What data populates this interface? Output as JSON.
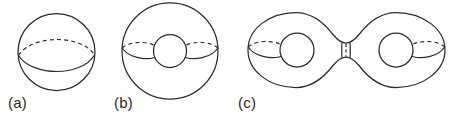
{
  "figure": {
    "caption_labels": {
      "a": "(a)",
      "b": "(b)",
      "c": "(c)"
    },
    "colors": {
      "background": "#ffffff",
      "ink": "#2b2b2b"
    },
    "panels": [
      {
        "id": "a",
        "label": "(a)",
        "name": "sphere",
        "genus": 0,
        "holes": 0,
        "outline": {
          "type": "circle",
          "cx": 56.5,
          "cy": 52,
          "r": 38.5
        },
        "curves": [
          {
            "name": "equator-back-arc",
            "style": "dashed",
            "path": "M 18.5 55.5 C 26 43.5, 44 39.5, 57 39.5 C 71 39.5, 88 44, 94.5 55"
          },
          {
            "name": "equator-front-arc",
            "style": "solid",
            "path": "M 18.5 55.5 C 25 66.5, 43 71.5, 57 71.5 C 71 71.5, 88 66.5, 94.5 55"
          }
        ]
      },
      {
        "id": "b",
        "label": "(b)",
        "name": "torus",
        "genus": 1,
        "holes": 1,
        "outline": {
          "type": "circle",
          "cx": 170,
          "cy": 51,
          "r": 48
        },
        "hole": {
          "type": "circle",
          "cx": 170,
          "cy": 51,
          "r": 16.5
        },
        "curves": [
          {
            "name": "left-handle-back-arc",
            "style": "dashed",
            "path": "M 122.2 48 C 129 41.5, 145 41, 153.6 45"
          },
          {
            "name": "left-handle-front-arc",
            "style": "solid",
            "path": "M 122.2 48 C 128 57.5, 145 60.5, 154.5 57.5"
          },
          {
            "name": "right-handle-back-arc",
            "style": "dashed",
            "path": "M 217.8 48 C 211 41.5, 195 41, 186.4 45"
          },
          {
            "name": "right-handle-front-arc",
            "style": "solid",
            "path": "M 217.8 48 C 212 57.5, 195 60.5, 185.5 57.5"
          }
        ]
      },
      {
        "id": "c",
        "label": "(c)",
        "name": "double-torus",
        "genus": 2,
        "holes": 2,
        "outline": {
          "type": "two-lobes-with-neck",
          "left_lobe": {
            "cx": 297,
            "cy": 50,
            "r": 49
          },
          "right_lobe": {
            "cx": 396,
            "cy": 50,
            "r": 49
          },
          "neck": {
            "cx": 346,
            "cy": 50,
            "half_width": 4.5,
            "half_height": 7
          }
        },
        "holes_geometry": [
          {
            "cx": 297,
            "cy": 50,
            "r": 17
          },
          {
            "cx": 396,
            "cy": 50,
            "r": 17
          }
        ],
        "curves": [
          {
            "name": "left-handle-back-arc",
            "style": "dashed",
            "path": "M 248.3 47 C 255 40.5, 271 40, 279.8 44"
          },
          {
            "name": "left-handle-front-arc",
            "style": "solid",
            "path": "M 248.3 47 C 254 56.5, 271 59.5, 280.6 56.5"
          },
          {
            "name": "right-handle-back-arc",
            "style": "dashed",
            "path": "M 444.7 47 C 438 40.5, 422 40, 413.2 44"
          },
          {
            "name": "right-handle-front-arc",
            "style": "solid",
            "path": "M 444.7 47 C 439 56.5, 422 59.5, 412.4 56.5"
          },
          {
            "name": "neck-left-edge",
            "style": "solid",
            "path": "M 341.8 43.5 L 341.8 57"
          },
          {
            "name": "neck-right-edge",
            "style": "solid",
            "path": "M 350.2 43.5 L 350.2 57"
          },
          {
            "name": "neck-back-seam",
            "style": "dashed",
            "path": "M 346 44 L 346 56.5"
          }
        ]
      }
    ]
  }
}
